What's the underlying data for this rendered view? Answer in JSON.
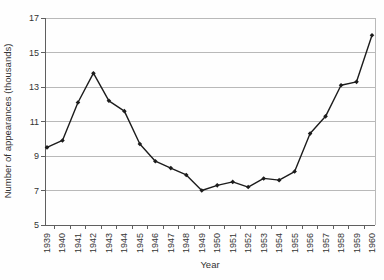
{
  "chart_data": {
    "type": "line",
    "title": "",
    "xlabel": "Year",
    "ylabel": "Number of appearances (thousands)",
    "categories": [
      "1939",
      "1940",
      "1941",
      "1942",
      "1943",
      "1944",
      "1945",
      "1946",
      "1947",
      "1948",
      "1949",
      "1950",
      "1951",
      "1952",
      "1953",
      "1954",
      "1955",
      "1956",
      "1957",
      "1958",
      "1959",
      "1960"
    ],
    "series": [
      {
        "name": "Number of appearances",
        "values": [
          9.5,
          9.9,
          12.1,
          13.8,
          12.2,
          11.6,
          9.7,
          8.7,
          8.3,
          7.9,
          7.0,
          7.3,
          7.5,
          7.2,
          7.7,
          7.6,
          8.1,
          10.3,
          11.3,
          13.1,
          13.3,
          16.0
        ]
      }
    ],
    "ylim": [
      5,
      17
    ],
    "yticks": [
      5,
      7,
      9,
      11,
      13,
      15,
      17
    ],
    "grid": true,
    "legend": "none",
    "marker": "diamond",
    "colors": {
      "line": "#1c1c1c",
      "gridline": "#b9b9b9",
      "axis_line": "#5f5f5f",
      "text": "#333333",
      "background": "#fefefe"
    }
  }
}
